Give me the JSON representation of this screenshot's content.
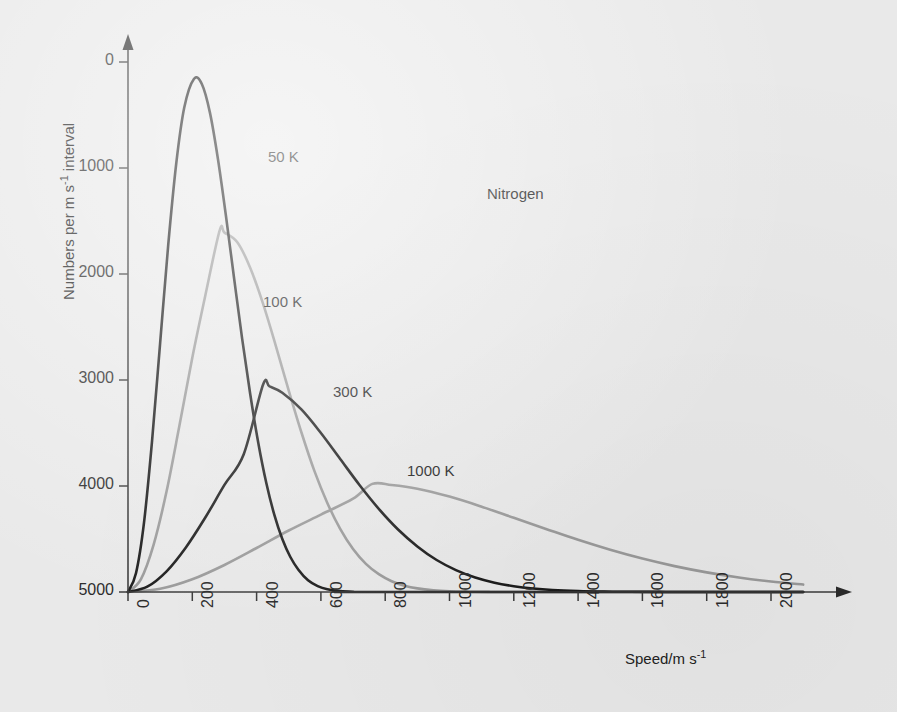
{
  "chart_data": {
    "type": "line",
    "title": "",
    "annotation": "Nitrogen",
    "xlabel": "Speed/m s",
    "xlabel_sup": "-1",
    "ylabel": "Numbers per m s",
    "ylabel_sup": "-1",
    "ylabel_tail": " interval",
    "xlim": [
      0,
      2100
    ],
    "ylim": [
      0,
      5200
    ],
    "grid": false,
    "legend": "inline curve labels",
    "xticks": [
      0,
      200,
      400,
      600,
      800,
      1000,
      1200,
      1400,
      1600,
      1800,
      2000
    ],
    "yticks": [
      0,
      1000,
      2000,
      3000,
      4000,
      5000
    ],
    "series": [
      {
        "name": "50 K",
        "label": "50 K",
        "color": "#1c1c1c",
        "width": 2.6,
        "temperature_K": 50,
        "peak_speed": 205,
        "peak_value": 4840,
        "label_xy": [
          268,
          148
        ],
        "points": [
          [
            0,
            0
          ],
          [
            25,
            180
          ],
          [
            50,
            660
          ],
          [
            75,
            1430
          ],
          [
            100,
            2350
          ],
          [
            125,
            3270
          ],
          [
            150,
            4040
          ],
          [
            175,
            4570
          ],
          [
            205,
            4840
          ],
          [
            230,
            4790
          ],
          [
            255,
            4520
          ],
          [
            280,
            4080
          ],
          [
            305,
            3540
          ],
          [
            330,
            2960
          ],
          [
            355,
            2390
          ],
          [
            380,
            1870
          ],
          [
            405,
            1410
          ],
          [
            430,
            1030
          ],
          [
            455,
            730
          ],
          [
            480,
            500
          ],
          [
            505,
            330
          ],
          [
            530,
            210
          ],
          [
            560,
            110
          ],
          [
            590,
            55
          ],
          [
            620,
            25
          ],
          [
            660,
            8
          ],
          [
            700,
            2
          ],
          [
            760,
            0
          ],
          [
            2100,
            0
          ]
        ]
      },
      {
        "name": "100 K",
        "label": "100 K",
        "color": "#9a9a9a",
        "width": 2.6,
        "temperature_K": 100,
        "peak_speed": 285,
        "peak_value": 3410,
        "label_xy": [
          263,
          293
        ],
        "points": [
          [
            0,
            0
          ],
          [
            40,
            120
          ],
          [
            80,
            450
          ],
          [
            120,
            950
          ],
          [
            160,
            1570
          ],
          [
            200,
            2210
          ],
          [
            240,
            2790
          ],
          [
            285,
            3410
          ],
          [
            300,
            3390
          ],
          [
            340,
            3300
          ],
          [
            380,
            3060
          ],
          [
            420,
            2720
          ],
          [
            460,
            2320
          ],
          [
            500,
            1900
          ],
          [
            540,
            1500
          ],
          [
            580,
            1140
          ],
          [
            620,
            840
          ],
          [
            660,
            595
          ],
          [
            700,
            405
          ],
          [
            740,
            265
          ],
          [
            780,
            168
          ],
          [
            820,
            102
          ],
          [
            860,
            60
          ],
          [
            900,
            34
          ],
          [
            950,
            16
          ],
          [
            1000,
            7
          ],
          [
            1060,
            3
          ],
          [
            1120,
            1
          ],
          [
            1200,
            0
          ],
          [
            2100,
            0
          ]
        ]
      },
      {
        "name": "300 K",
        "label": "300 K",
        "color": "#1c1c1c",
        "width": 2.6,
        "temperature_K": 300,
        "peak_speed": 420,
        "peak_value": 1955,
        "label_xy": [
          333,
          383
        ],
        "points": [
          [
            0,
            0
          ],
          [
            60,
            50
          ],
          [
            120,
            195
          ],
          [
            180,
            420
          ],
          [
            240,
            700
          ],
          [
            300,
            1010
          ],
          [
            360,
            1300
          ],
          [
            420,
            1955
          ],
          [
            440,
            1940
          ],
          [
            480,
            1880
          ],
          [
            540,
            1720
          ],
          [
            600,
            1500
          ],
          [
            660,
            1255
          ],
          [
            720,
            1010
          ],
          [
            780,
            785
          ],
          [
            840,
            590
          ],
          [
            900,
            430
          ],
          [
            960,
            302
          ],
          [
            1020,
            207
          ],
          [
            1080,
            137
          ],
          [
            1140,
            88
          ],
          [
            1200,
            55
          ],
          [
            1260,
            33
          ],
          [
            1320,
            19
          ],
          [
            1400,
            9
          ],
          [
            1480,
            4
          ],
          [
            1560,
            2
          ],
          [
            1650,
            1
          ],
          [
            1750,
            0
          ],
          [
            2100,
            0
          ]
        ]
      },
      {
        "name": "1000 K",
        "label": "1000 K",
        "color": "#9a9a9a",
        "width": 2.6,
        "temperature_K": 1000,
        "peak_speed": 760,
        "peak_value": 1020,
        "label_xy": [
          407,
          462
        ],
        "points": [
          [
            0,
            0
          ],
          [
            100,
            30
          ],
          [
            200,
            120
          ],
          [
            300,
            255
          ],
          [
            400,
            415
          ],
          [
            500,
            580
          ],
          [
            600,
            730
          ],
          [
            700,
            880
          ],
          [
            760,
            1020
          ],
          [
            820,
            1010
          ],
          [
            900,
            975
          ],
          [
            1000,
            900
          ],
          [
            1100,
            805
          ],
          [
            1200,
            700
          ],
          [
            1300,
            595
          ],
          [
            1400,
            492
          ],
          [
            1500,
            398
          ],
          [
            1600,
            315
          ],
          [
            1700,
            244
          ],
          [
            1800,
            185
          ],
          [
            1900,
            137
          ],
          [
            2000,
            99
          ],
          [
            2100,
            70
          ]
        ]
      }
    ]
  },
  "axes": {
    "y_tick_labels": [
      "5000",
      "4000",
      "3000",
      "2000",
      "1000",
      "0"
    ],
    "x_tick_labels": [
      "0",
      "200",
      "400",
      "600",
      "800",
      "1000",
      "1200",
      "1400",
      "1600",
      "1800",
      "2000"
    ]
  },
  "colors": {
    "background": "#e9e9e9",
    "axis": "#3a3a3a",
    "dark_curve": "#1c1c1c",
    "light_curve": "#9a9a9a",
    "text": "#222222"
  }
}
